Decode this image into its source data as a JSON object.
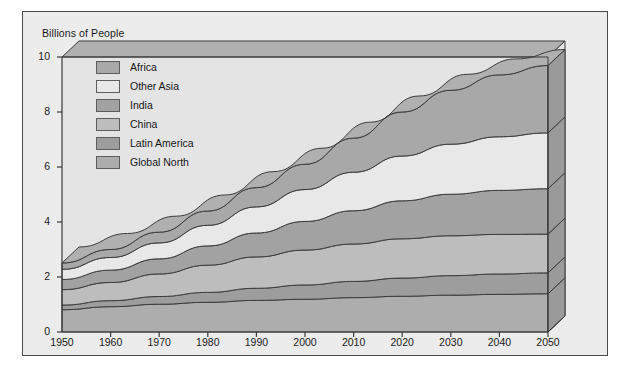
{
  "axis_title": "Billions of People",
  "colors": {
    "page_bg": "#ffffff",
    "card_bg": "#ececed",
    "frame": "#4a4a4a",
    "line": "#3a3a3a",
    "top_face": "#b0b0b0",
    "side_face": "#9a9a9a",
    "plot_bg": "#e4e4e5"
  },
  "legend": {
    "items": [
      {
        "label": "Africa",
        "color": "#a8a8a8"
      },
      {
        "label": "Other Asia",
        "color": "#e8e8e8"
      },
      {
        "label": "India",
        "color": "#a2a2a2"
      },
      {
        "label": "China",
        "color": "#bdbdbd"
      },
      {
        "label": "Latin America",
        "color": "#9d9d9d"
      },
      {
        "label": "Global North",
        "color": "#adadad"
      }
    ]
  },
  "chart_data": {
    "type": "area",
    "title": "",
    "subtitle": "",
    "xlabel": "",
    "ylabel": "Billions of People",
    "xlim": [
      1950,
      2050
    ],
    "ylim": [
      0,
      10
    ],
    "yticks": [
      0,
      2,
      4,
      6,
      8,
      10
    ],
    "grid": false,
    "stacked": true,
    "legend_position": "inside-top-left",
    "three_d": true,
    "x": [
      1950,
      1960,
      1970,
      1980,
      1990,
      2000,
      2010,
      2020,
      2030,
      2040,
      2050
    ],
    "categories": [
      "1950",
      "1960",
      "1970",
      "1980",
      "1990",
      "2000",
      "2010",
      "2020",
      "2030",
      "2040",
      "2050"
    ],
    "series": [
      {
        "name": "Global North",
        "color": "#adadad",
        "values": [
          0.81,
          0.92,
          1.01,
          1.08,
          1.15,
          1.19,
          1.25,
          1.3,
          1.34,
          1.37,
          1.39
        ]
      },
      {
        "name": "Latin America",
        "color": "#9d9d9d",
        "values": [
          0.17,
          0.22,
          0.28,
          0.36,
          0.44,
          0.52,
          0.59,
          0.66,
          0.71,
          0.74,
          0.76
        ]
      },
      {
        "name": "China",
        "color": "#bdbdbd",
        "values": [
          0.56,
          0.66,
          0.82,
          0.99,
          1.14,
          1.27,
          1.36,
          1.43,
          1.45,
          1.44,
          1.41
        ]
      },
      {
        "name": "India",
        "color": "#a2a2a2",
        "values": [
          0.37,
          0.45,
          0.55,
          0.7,
          0.87,
          1.04,
          1.21,
          1.38,
          1.51,
          1.6,
          1.65
        ]
      },
      {
        "name": "Other Asia",
        "color": "#e8e8e8",
        "values": [
          0.37,
          0.46,
          0.58,
          0.75,
          0.95,
          1.16,
          1.4,
          1.63,
          1.82,
          1.95,
          2.03
        ]
      },
      {
        "name": "Africa",
        "color": "#a8a8a8",
        "values": [
          0.23,
          0.29,
          0.39,
          0.52,
          0.7,
          0.92,
          1.24,
          1.6,
          1.96,
          2.25,
          2.45
        ]
      }
    ],
    "cumulative_totals": [
      2.51,
      3.0,
      3.63,
      4.4,
      5.25,
      6.1,
      7.05,
      8.0,
      8.79,
      9.35,
      9.69
    ]
  }
}
